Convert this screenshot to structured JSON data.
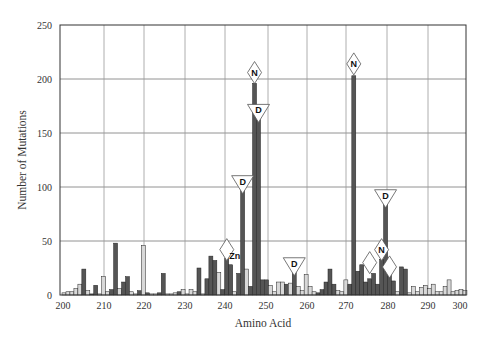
{
  "chart_data": {
    "type": "bar",
    "title": "",
    "xlabel": "Amino Acid",
    "ylabel": "Number of Mutations",
    "xlim": [
      200,
      302
    ],
    "ylim": [
      0,
      250
    ],
    "x_ticks": [
      200,
      210,
      220,
      230,
      240,
      250,
      260,
      270,
      280,
      290,
      300
    ],
    "y_ticks": [
      0,
      50,
      100,
      150,
      200,
      250
    ],
    "grid": true,
    "legend": null,
    "colors": {
      "dark": "#555555",
      "light": "#d8d8d8",
      "edge": "#222222"
    },
    "bars": [
      {
        "x": 200,
        "v": 2,
        "c": "light"
      },
      {
        "x": 201,
        "v": 3,
        "c": "light"
      },
      {
        "x": 202,
        "v": 3,
        "c": "light"
      },
      {
        "x": 203,
        "v": 6,
        "c": "light"
      },
      {
        "x": 204,
        "v": 10,
        "c": "light"
      },
      {
        "x": 205,
        "v": 24,
        "c": "dark"
      },
      {
        "x": 206,
        "v": 4,
        "c": "light"
      },
      {
        "x": 207,
        "v": 1,
        "c": "dark"
      },
      {
        "x": 208,
        "v": 9,
        "c": "dark"
      },
      {
        "x": 209,
        "v": 1,
        "c": "light"
      },
      {
        "x": 210,
        "v": 17,
        "c": "light"
      },
      {
        "x": 211,
        "v": 3,
        "c": "light"
      },
      {
        "x": 212,
        "v": 5,
        "c": "dark"
      },
      {
        "x": 213,
        "v": 48,
        "c": "dark"
      },
      {
        "x": 214,
        "v": 6,
        "c": "light"
      },
      {
        "x": 215,
        "v": 12,
        "c": "dark"
      },
      {
        "x": 216,
        "v": 17,
        "c": "dark"
      },
      {
        "x": 217,
        "v": 3,
        "c": "light"
      },
      {
        "x": 218,
        "v": 1,
        "c": "light"
      },
      {
        "x": 219,
        "v": 4,
        "c": "dark"
      },
      {
        "x": 220,
        "v": 46,
        "c": "light"
      },
      {
        "x": 221,
        "v": 2,
        "c": "dark"
      },
      {
        "x": 222,
        "v": 1,
        "c": "light"
      },
      {
        "x": 223,
        "v": 1,
        "c": "light"
      },
      {
        "x": 224,
        "v": 2,
        "c": "dark"
      },
      {
        "x": 225,
        "v": 20,
        "c": "dark"
      },
      {
        "x": 226,
        "v": 1,
        "c": "light"
      },
      {
        "x": 227,
        "v": 1,
        "c": "light"
      },
      {
        "x": 228,
        "v": 2,
        "c": "light"
      },
      {
        "x": 229,
        "v": 3,
        "c": "dark"
      },
      {
        "x": 230,
        "v": 5,
        "c": "light"
      },
      {
        "x": 231,
        "v": 1,
        "c": "light"
      },
      {
        "x": 232,
        "v": 5,
        "c": "light"
      },
      {
        "x": 233,
        "v": 3,
        "c": "light"
      },
      {
        "x": 234,
        "v": 25,
        "c": "dark"
      },
      {
        "x": 235,
        "v": 1,
        "c": "light"
      },
      {
        "x": 236,
        "v": 15,
        "c": "dark"
      },
      {
        "x": 237,
        "v": 36,
        "c": "dark"
      },
      {
        "x": 238,
        "v": 32,
        "c": "dark"
      },
      {
        "x": 239,
        "v": 21,
        "c": "light"
      },
      {
        "x": 240,
        "v": 5,
        "c": "dark"
      },
      {
        "x": 241,
        "v": 34,
        "c": "dark"
      },
      {
        "x": 242,
        "v": 28,
        "c": "dark"
      },
      {
        "x": 243,
        "v": 3,
        "c": "light"
      },
      {
        "x": 244,
        "v": 20,
        "c": "dark"
      },
      {
        "x": 245,
        "v": 101,
        "c": "dark"
      },
      {
        "x": 246,
        "v": 24,
        "c": "light"
      },
      {
        "x": 247,
        "v": 8,
        "c": "dark"
      },
      {
        "x": 248,
        "v": 196,
        "c": "dark"
      },
      {
        "x": 249,
        "v": 175,
        "c": "dark"
      },
      {
        "x": 250,
        "v": 14,
        "c": "dark"
      },
      {
        "x": 251,
        "v": 14,
        "c": "dark"
      },
      {
        "x": 252,
        "v": 9,
        "c": "light"
      },
      {
        "x": 253,
        "v": 3,
        "c": "light"
      },
      {
        "x": 254,
        "v": 12,
        "c": "light"
      },
      {
        "x": 255,
        "v": 12,
        "c": "light"
      },
      {
        "x": 256,
        "v": 10,
        "c": "dark"
      },
      {
        "x": 257,
        "v": 11,
        "c": "light"
      },
      {
        "x": 258,
        "v": 22,
        "c": "dark"
      },
      {
        "x": 259,
        "v": 8,
        "c": "light"
      },
      {
        "x": 260,
        "v": 4,
        "c": "light"
      },
      {
        "x": 261,
        "v": 19,
        "c": "light"
      },
      {
        "x": 262,
        "v": 8,
        "c": "light"
      },
      {
        "x": 263,
        "v": 3,
        "c": "light"
      },
      {
        "x": 264,
        "v": 2,
        "c": "dark"
      },
      {
        "x": 265,
        "v": 5,
        "c": "dark"
      },
      {
        "x": 266,
        "v": 12,
        "c": "dark"
      },
      {
        "x": 267,
        "v": 24,
        "c": "dark"
      },
      {
        "x": 268,
        "v": 10,
        "c": "dark"
      },
      {
        "x": 269,
        "v": 4,
        "c": "light"
      },
      {
        "x": 270,
        "v": 3,
        "c": "light"
      },
      {
        "x": 271,
        "v": 14,
        "c": "light"
      },
      {
        "x": 272,
        "v": 10,
        "c": "dark"
      },
      {
        "x": 273,
        "v": 203,
        "c": "dark"
      },
      {
        "x": 274,
        "v": 22,
        "c": "dark"
      },
      {
        "x": 275,
        "v": 28,
        "c": "dark"
      },
      {
        "x": 276,
        "v": 12,
        "c": "dark"
      },
      {
        "x": 277,
        "v": 15,
        "c": "dark"
      },
      {
        "x": 278,
        "v": 20,
        "c": "dark"
      },
      {
        "x": 279,
        "v": 10,
        "c": "dark"
      },
      {
        "x": 280,
        "v": 33,
        "c": "dark"
      },
      {
        "x": 281,
        "v": 88,
        "c": "dark"
      },
      {
        "x": 282,
        "v": 26,
        "c": "dark"
      },
      {
        "x": 283,
        "v": 13,
        "c": "dark"
      },
      {
        "x": 284,
        "v": 3,
        "c": "light"
      },
      {
        "x": 285,
        "v": 26,
        "c": "dark"
      },
      {
        "x": 286,
        "v": 24,
        "c": "dark"
      },
      {
        "x": 287,
        "v": 2,
        "c": "light"
      },
      {
        "x": 288,
        "v": 8,
        "c": "light"
      },
      {
        "x": 289,
        "v": 3,
        "c": "light"
      },
      {
        "x": 290,
        "v": 7,
        "c": "light"
      },
      {
        "x": 291,
        "v": 9,
        "c": "light"
      },
      {
        "x": 292,
        "v": 6,
        "c": "light"
      },
      {
        "x": 293,
        "v": 10,
        "c": "light"
      },
      {
        "x": 294,
        "v": 3,
        "c": "light"
      },
      {
        "x": 295,
        "v": 3,
        "c": "light"
      },
      {
        "x": 296,
        "v": 8,
        "c": "light"
      },
      {
        "x": 297,
        "v": 14,
        "c": "light"
      },
      {
        "x": 298,
        "v": 3,
        "c": "light"
      },
      {
        "x": 299,
        "v": 4,
        "c": "light"
      },
      {
        "x": 300,
        "v": 5,
        "c": "light"
      },
      {
        "x": 301,
        "v": 4,
        "c": "light"
      }
    ],
    "annotations": [
      {
        "x": 248,
        "y": 206,
        "shape": "diamond",
        "label": "N"
      },
      {
        "x": 249,
        "y": 170,
        "shape": "triangle-down",
        "label": "D"
      },
      {
        "x": 245,
        "y": 104,
        "shape": "triangle-down",
        "label": "D"
      },
      {
        "x": 241,
        "y": 42,
        "shape": "diamond",
        "label": ""
      },
      {
        "x": 243,
        "y": 33,
        "shape": "text",
        "label": "Zn"
      },
      {
        "x": 258,
        "y": 28,
        "shape": "triangle-down",
        "label": "D"
      },
      {
        "x": 273,
        "y": 214,
        "shape": "diamond",
        "label": "N"
      },
      {
        "x": 281,
        "y": 91,
        "shape": "triangle-down",
        "label": "D"
      },
      {
        "x": 280,
        "y": 42,
        "shape": "diamond",
        "label": "N"
      },
      {
        "x": 277,
        "y": 30,
        "shape": "diamond",
        "label": ""
      },
      {
        "x": 282,
        "y": 26,
        "shape": "diamond",
        "label": ""
      }
    ]
  }
}
